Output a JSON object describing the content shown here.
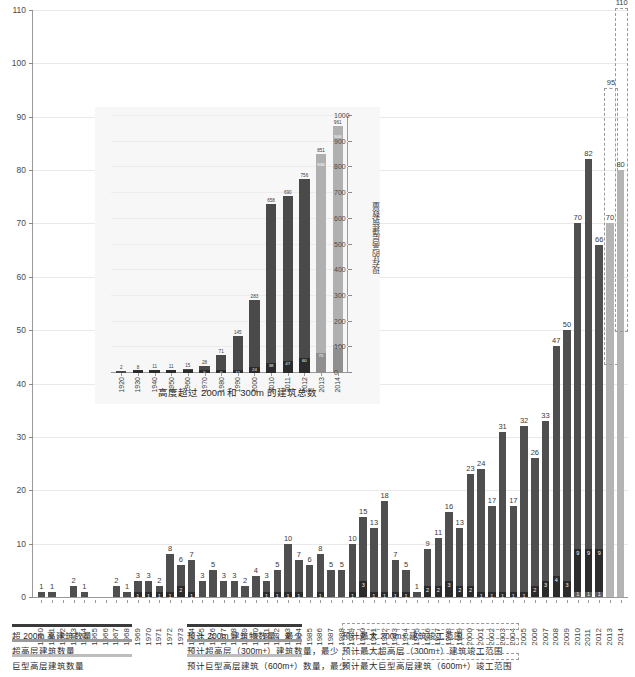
{
  "chart_data": {
    "type": "bar",
    "title": "",
    "ylabel": "",
    "xlabel": "",
    "ylim": [
      0,
      110
    ],
    "yticks": [
      0,
      10,
      20,
      30,
      40,
      50,
      60,
      70,
      80,
      90,
      100,
      110
    ],
    "grid": true,
    "stacked": true,
    "categories": [
      "1960",
      "1961",
      "1962",
      "1963",
      "1964",
      "1965",
      "1966",
      "1967",
      "1968",
      "1969",
      "1970",
      "1971",
      "1972",
      "1973",
      "1974",
      "1975",
      "1976",
      "1977",
      "1978",
      "1979",
      "1980",
      "1981",
      "1982",
      "1983",
      "1984",
      "1985",
      "1986",
      "1987",
      "1988",
      "1989",
      "1990",
      "1991",
      "1992",
      "1993",
      "1994",
      "1995",
      "1996",
      "1997",
      "1998",
      "1999",
      "2000",
      "2001",
      "2002",
      "2003",
      "2004",
      "2005",
      "2006",
      "2007",
      "2008",
      "2009",
      "2010",
      "2011",
      "2012",
      "2013",
      "2014"
    ],
    "series": [
      {
        "name": "超 200m 高建筑数量",
        "color": "#4f4f4f",
        "values": [
          1,
          1,
          0,
          2,
          1,
          0,
          0,
          2,
          1,
          3,
          3,
          2,
          8,
          6,
          7,
          3,
          5,
          3,
          3,
          2,
          4,
          3,
          5,
          10,
          7,
          6,
          8,
          5,
          5,
          10,
          15,
          13,
          18,
          7,
          5,
          1,
          9,
          11,
          16,
          13,
          23,
          24,
          17,
          31,
          17,
          32,
          26,
          33,
          47,
          50,
          70,
          82,
          66,
          70,
          80
        ]
      },
      {
        "name": "超高层建筑数量",
        "color": "#2b2b2b",
        "values": [
          0,
          0,
          0,
          0,
          0,
          0,
          0,
          0,
          0,
          1,
          1,
          1,
          1,
          2,
          1,
          0,
          0,
          0,
          0,
          0,
          0,
          1,
          1,
          1,
          1,
          0,
          1,
          0,
          0,
          1,
          3,
          1,
          1,
          1,
          1,
          0,
          2,
          2,
          3,
          2,
          2,
          1,
          1,
          1,
          1,
          1,
          2,
          3,
          4,
          3,
          9,
          9,
          9,
          null,
          null
        ]
      },
      {
        "name": "巨型高层建筑数量",
        "color": "#5b5b5b",
        "values": [
          0,
          0,
          0,
          0,
          0,
          0,
          0,
          0,
          0,
          0,
          0,
          0,
          0,
          0,
          0,
          0,
          0,
          0,
          0,
          0,
          0,
          0,
          0,
          0,
          0,
          0,
          0,
          0,
          0,
          0,
          0,
          0,
          0,
          0,
          0,
          0,
          0,
          0,
          0,
          0,
          0,
          0,
          0,
          0,
          0,
          0,
          0,
          0,
          0,
          0,
          1,
          1,
          1,
          null,
          null
        ]
      }
    ],
    "projection_years": [
      "2013",
      "2014"
    ],
    "projection_min": {
      "2013": 70,
      "2014": 80
    },
    "projection_max": {
      "2013": 95,
      "2014": 110
    },
    "bar_labels": {
      "1960": "1",
      "1961": "1",
      "1963": "2",
      "1964": "1",
      "1967": "2",
      "1968": "1",
      "1969": "3",
      "1970": "3",
      "1971": "2",
      "1972": "8",
      "1973": "6",
      "1974": "7",
      "1975": "3",
      "1976": "5",
      "1977": "3",
      "1978": "3",
      "1979": "2",
      "1980": "4",
      "1981": "3",
      "1982": "5",
      "1983": "10",
      "1984": "7",
      "1985": "6",
      "1986": "8",
      "1987": "5",
      "1988": "5",
      "1989": "10",
      "1990": "15",
      "1991": "13",
      "1992": "18",
      "1993": "7",
      "1994": "5",
      "1995": "1",
      "1996": "9",
      "1997": "11",
      "1998": "16",
      "1999": "13",
      "2000": "23",
      "2001": "24",
      "2002": "17",
      "2003": "31",
      "2004": "17",
      "2005": "32",
      "2006": "26",
      "2007": "33",
      "2008": "47",
      "2009": "50",
      "2010": "70",
      "2011": "82",
      "2012": "66",
      "2013": "70",
      "2014": "80"
    },
    "projection_max_labels": {
      "2013": "95",
      "2014": "110"
    }
  },
  "inset_chart": {
    "type": "bar",
    "title": "高度超过 200m 和 300m 的建筑总数",
    "ylabel": "现存的高层建筑数量",
    "ylim": [
      0,
      1000
    ],
    "yticks": [
      0,
      100,
      200,
      300,
      400,
      500,
      600,
      700,
      800,
      900,
      1000
    ],
    "categories": [
      "1920",
      "1930",
      "1940",
      "1950",
      "1960",
      "1970",
      "1980",
      "1990",
      "2000",
      "2010",
      "2011",
      "2012",
      "2013",
      "2014"
    ],
    "series": [
      {
        "name": "200m+ 建筑总数",
        "color": "#4a4a4a",
        "totals": [
          2,
          8,
          11,
          11,
          15,
          28,
          71,
          145,
          283,
          658,
          690,
          756,
          851,
          961
        ]
      },
      {
        "name": "300m+ 建筑总数",
        "color": "#2b2b2b",
        "values": [
          0,
          1,
          2,
          2,
          3,
          5,
          6,
          11,
          24,
          38,
          47,
          60,
          76,
          108
        ]
      }
    ],
    "projection_categories": [
      "2013",
      "2014"
    ],
    "projection_inner_labels": {
      "2013": "836",
      "2014": "908"
    },
    "top_labels": [
      "2",
      "8",
      "11",
      "11",
      "15",
      "28",
      "71",
      "145",
      "283",
      "658",
      "690",
      "756",
      "851",
      "961"
    ],
    "inner_labels": [
      "",
      "",
      "",
      "",
      "",
      "5",
      "6",
      "11",
      "24",
      "38",
      "47",
      "60",
      "76",
      "108"
    ]
  },
  "legend": {
    "rows": [
      {
        "cells": [
          {
            "swatch": "solid",
            "color": "#3a3a3a",
            "label": "超 200m 高建筑数量"
          },
          {
            "swatch": "solid",
            "color": "#3a3a3a",
            "label": "预计 200m 建筑物数量，最少"
          },
          {
            "swatch": "dashed",
            "color": "#9b9b9b",
            "label": "预计最大 200m+ 建筑竣工范围"
          }
        ]
      },
      {
        "cells": [
          {
            "swatch": "solid",
            "color": "#9a9a9a",
            "label": "超高层建筑数量"
          },
          {
            "swatch": "solid",
            "color": "#9a9a9a",
            "label": "预计超高层（300m+）建筑数量，最少"
          },
          {
            "swatch": "dashed",
            "color": "#9b9b9b",
            "label": "预计最大超高层（300m+）建筑竣工范围"
          }
        ]
      },
      {
        "cells": [
          {
            "swatch": "solid",
            "color": "#bdbdbd",
            "label": "巨型高层建筑数量"
          },
          {
            "swatch": "solid",
            "color": "#bdbdbd",
            "label": "预计巨型高层建筑（600m+）数量，最少"
          },
          {
            "swatch": "dashed",
            "color": "#9b9b9b",
            "label": "预计最大巨型高层建筑（600m+）竣工范围"
          }
        ]
      }
    ]
  }
}
